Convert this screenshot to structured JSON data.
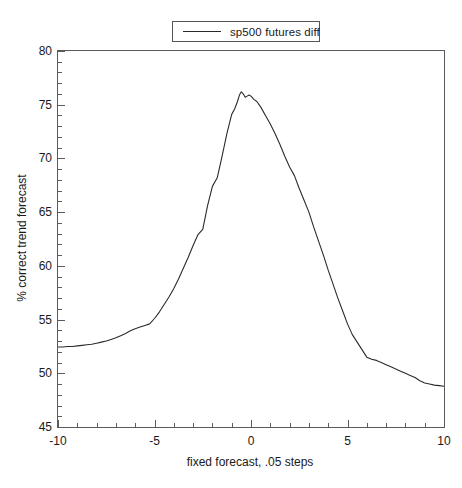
{
  "chart_data": {
    "type": "line",
    "title": "",
    "xlabel": "fixed forecast, .05 steps",
    "ylabel": "% correct trend forecast",
    "xlim": [
      -10,
      10
    ],
    "ylim": [
      45,
      80
    ],
    "grid": false,
    "legend_position": "top-center",
    "x_ticks": [
      -10,
      -5,
      0,
      5,
      10
    ],
    "x_tick_labels": [
      "-10",
      "-5",
      "0",
      "5",
      "10"
    ],
    "x_minor_tick_step": 1,
    "y_ticks": [
      45,
      50,
      55,
      60,
      65,
      70,
      75,
      80
    ],
    "y_tick_labels": [
      "45",
      "50",
      "55",
      "60",
      "65",
      "70",
      "75",
      "80"
    ],
    "y_minor_tick_step": 1,
    "line_color": "#2b2b2b",
    "frame_color": "#5a5a5a",
    "background_color": "#ffffff",
    "series": [
      {
        "name": "sp500 futures diff",
        "x": [
          -10.0,
          -9.75,
          -9.5,
          -9.25,
          -9.0,
          -8.75,
          -8.5,
          -8.25,
          -8.0,
          -7.75,
          -7.5,
          -7.25,
          -7.0,
          -6.75,
          -6.5,
          -6.25,
          -6.0,
          -5.75,
          -5.5,
          -5.25,
          -5.0,
          -4.75,
          -4.5,
          -4.25,
          -4.0,
          -3.75,
          -3.5,
          -3.25,
          -3.0,
          -2.75,
          -2.5,
          -2.25,
          -2.0,
          -1.75,
          -1.5,
          -1.25,
          -1.0,
          -0.85,
          -0.7,
          -0.6,
          -0.5,
          -0.4,
          -0.3,
          -0.2,
          -0.1,
          0.0,
          0.15,
          0.3,
          0.5,
          0.75,
          1.0,
          1.25,
          1.5,
          1.75,
          2.0,
          2.25,
          2.5,
          2.75,
          3.0,
          3.25,
          3.5,
          3.75,
          4.0,
          4.25,
          4.5,
          4.75,
          5.0,
          5.25,
          5.5,
          5.75,
          6.0,
          6.25,
          6.5,
          6.75,
          7.0,
          7.25,
          7.5,
          7.75,
          8.0,
          8.25,
          8.5,
          8.75,
          9.0,
          9.25,
          9.5,
          9.75,
          10.0
        ],
        "y": [
          52.45,
          52.45,
          52.5,
          52.5,
          52.55,
          52.6,
          52.65,
          52.7,
          52.8,
          52.9,
          53.0,
          53.15,
          53.3,
          53.5,
          53.7,
          53.95,
          54.15,
          54.3,
          54.45,
          54.6,
          55.1,
          55.7,
          56.4,
          57.1,
          57.9,
          58.8,
          59.8,
          60.8,
          61.9,
          62.9,
          63.4,
          65.6,
          67.4,
          68.2,
          70.2,
          72.3,
          74.1,
          74.6,
          75.3,
          75.9,
          76.2,
          76.0,
          75.7,
          75.8,
          75.9,
          75.8,
          75.5,
          75.3,
          74.8,
          74.0,
          73.2,
          72.3,
          71.3,
          70.2,
          69.2,
          68.4,
          67.2,
          66.1,
          65.0,
          63.6,
          62.3,
          61.0,
          59.6,
          58.3,
          57.0,
          55.8,
          54.6,
          53.6,
          52.9,
          52.2,
          51.5,
          51.3,
          51.2,
          51.0,
          50.8,
          50.6,
          50.4,
          50.2,
          50.0,
          49.8,
          49.6,
          49.3,
          49.1,
          49.0,
          48.9,
          48.85,
          48.8
        ]
      }
    ]
  },
  "legend": {
    "entries": [
      {
        "label": "sp500 futures diff",
        "color": "#2b2b2b"
      }
    ]
  },
  "axes": {
    "x_title": "fixed forecast, .05 steps",
    "y_title": "% correct trend forecast"
  }
}
